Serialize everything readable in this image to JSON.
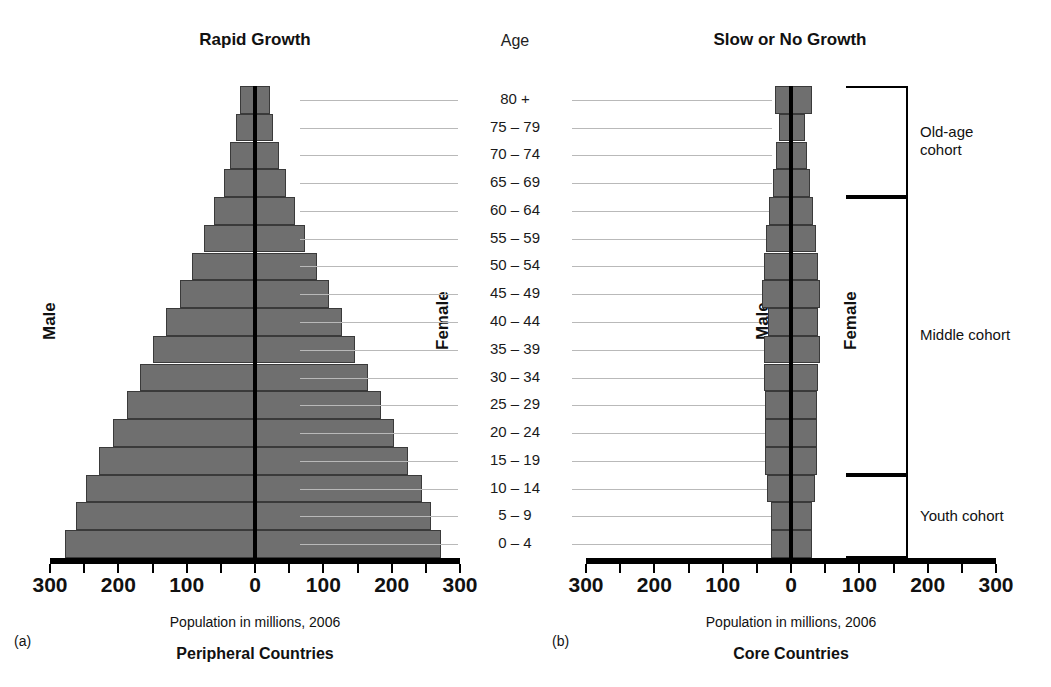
{
  "figure": {
    "age_header": "Age",
    "axis_caption": "Population in millions, 2006"
  },
  "panels": [
    {
      "id": "a",
      "letter": "(a)",
      "title": "Rapid Growth",
      "caption": "Peripheral Countries",
      "male_label": "Male",
      "female_label": "Female"
    },
    {
      "id": "b",
      "letter": "(b)",
      "title": "Slow or No Growth",
      "caption": "Core Countries",
      "male_label": "Male",
      "female_label": "Female"
    }
  ],
  "age_groups": [
    "80 +",
    "75 – 79",
    "70 – 74",
    "65 – 69",
    "60 – 64",
    "55 – 59",
    "50 – 54",
    "45 – 49",
    "40 – 44",
    "35 – 39",
    "30 – 34",
    "25 – 29",
    "20 – 24",
    "15 – 19",
    "10 – 14",
    "5 – 9",
    "0 – 4"
  ],
  "axis": {
    "ticks": [
      300,
      250,
      200,
      150,
      100,
      50,
      0,
      50,
      100,
      150,
      200,
      250,
      300
    ],
    "tick_labels": [
      "300",
      "",
      "200",
      "",
      "100",
      "",
      "0",
      "",
      "100",
      "",
      "200",
      "",
      "300"
    ],
    "min": -300,
    "max": 300
  },
  "cohorts": [
    {
      "label": "Old-age\ncohort",
      "top_age": "80 +",
      "bottom_age": "65 – 69"
    },
    {
      "label": "Middle cohort",
      "top_age": "60 – 64",
      "bottom_age": "15 – 19"
    },
    {
      "label": "Youth cohort",
      "top_age": "10 – 14",
      "bottom_age": "0 – 4"
    }
  ],
  "colors": {
    "bar_fill": "#6f6f6f",
    "bar_edge": "#3a3a3a",
    "spine": "#000000",
    "leader_line": "#b9b9b9"
  },
  "chart_data": {
    "type": "bar",
    "subtype": "population-pyramid",
    "xlabel": "Population in millions, 2006",
    "ylabel": "Age",
    "xlim": [
      -300,
      300
    ],
    "xtick_values": [
      300,
      200,
      100,
      0,
      100,
      200,
      300
    ],
    "grid": false,
    "legend": "none",
    "categories": [
      "0 – 4",
      "5 – 9",
      "10 – 14",
      "15 – 19",
      "20 – 24",
      "25 – 29",
      "30 – 34",
      "35 – 39",
      "40 – 44",
      "45 – 49",
      "50 – 54",
      "55 – 59",
      "60 – 64",
      "65 – 69",
      "70 – 74",
      "75 – 79",
      "80 +"
    ],
    "panels": [
      {
        "name": "Rapid Growth — Peripheral Countries",
        "series": [
          {
            "name": "Male",
            "side": "left",
            "values": [
              278,
              262,
              248,
              228,
              208,
              188,
              168,
              150,
              130,
              110,
              92,
              75,
              60,
              46,
              36,
              28,
              22
            ]
          },
          {
            "name": "Female",
            "side": "right",
            "values": [
              272,
              258,
              244,
              224,
              204,
              184,
              165,
              147,
              128,
              108,
              90,
              73,
              58,
              45,
              35,
              27,
              22
            ]
          }
        ]
      },
      {
        "name": "Slow or No Growth — Core Countries",
        "series": [
          {
            "name": "Male",
            "side": "left",
            "values": [
              30,
              30,
              35,
              38,
              38,
              38,
              40,
              40,
              34,
              42,
              40,
              36,
              32,
              26,
              22,
              18,
              24
            ]
          },
          {
            "name": "Female",
            "side": "right",
            "values": [
              30,
              30,
              35,
              38,
              38,
              38,
              40,
              42,
              40,
              42,
              40,
              36,
              32,
              28,
              24,
              20,
              30
            ]
          }
        ]
      }
    ]
  }
}
